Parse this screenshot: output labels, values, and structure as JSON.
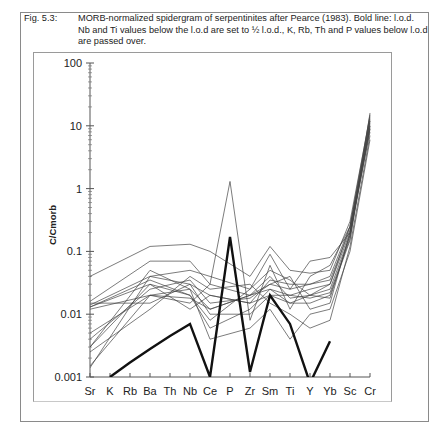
{
  "caption": {
    "label": "Fig. 5.3:",
    "text": "MORB-normalized spidergram of serpentinites after Pearce (1983). Bold line: l.o.d. Nb and Ti values below the l.o.d are set to ½ l.o.d., K, Rb, Th and P values below l.o.d are passed over."
  },
  "chart_data": {
    "type": "line",
    "title": "MORB-normalized spidergram of serpentinites after Pearce (1983)",
    "xlabel": "",
    "ylabel": "C/Cmorb",
    "yscale": "log",
    "ylim": [
      0.001,
      100
    ],
    "yticks": [
      "100",
      "10",
      "1",
      "0.1",
      "0.01",
      "0.001"
    ],
    "grid": false,
    "legend": null,
    "categories": [
      "Sr",
      "K",
      "Rb",
      "Ba",
      "Th",
      "Nb",
      "Ce",
      "P",
      "Zr",
      "Sm",
      "Ti",
      "Y",
      "Yb",
      "Sc",
      "Cr"
    ],
    "series": [
      {
        "name": "sample 1",
        "bold": false,
        "values": [
          0.04,
          null,
          null,
          0.12,
          null,
          0.13,
          0.1,
          null,
          0.04,
          0.12,
          0.05,
          0.045,
          0.05,
          0.3,
          14
        ]
      },
      {
        "name": "sample 2",
        "bold": false,
        "values": [
          0.016,
          null,
          null,
          0.07,
          null,
          0.07,
          0.03,
          1.3,
          0.008,
          0.06,
          0.012,
          0.04,
          0.06,
          0.25,
          12
        ]
      },
      {
        "name": "sample 3",
        "bold": false,
        "values": [
          0.014,
          null,
          null,
          0.04,
          null,
          0.05,
          0.04,
          null,
          0.025,
          0.09,
          0.025,
          0.07,
          0.08,
          0.2,
          10
        ]
      },
      {
        "name": "sample 4",
        "bold": false,
        "values": [
          0.0014,
          null,
          null,
          0.04,
          null,
          0.03,
          0.02,
          null,
          0.015,
          0.035,
          0.03,
          0.03,
          0.04,
          0.25,
          9
        ]
      },
      {
        "name": "sample 5",
        "bold": false,
        "values": [
          0.003,
          null,
          null,
          0.03,
          null,
          0.02,
          0.006,
          null,
          0.012,
          0.025,
          0.02,
          0.025,
          0.03,
          0.2,
          8
        ]
      },
      {
        "name": "sample 6",
        "bold": false,
        "values": [
          0.012,
          null,
          null,
          0.02,
          null,
          0.018,
          0.012,
          null,
          0.02,
          0.04,
          0.018,
          0.02,
          0.025,
          0.18,
          11
        ]
      },
      {
        "name": "sample 7",
        "bold": false,
        "values": [
          0.015,
          null,
          null,
          0.015,
          null,
          0.03,
          0.01,
          null,
          0.01,
          0.02,
          0.015,
          0.015,
          0.02,
          0.15,
          16
        ]
      },
      {
        "name": "sample 8",
        "bold": false,
        "values": [
          0.004,
          null,
          null,
          0.025,
          null,
          0.035,
          0.015,
          null,
          0.018,
          0.03,
          0.04,
          0.012,
          0.015,
          0.2,
          12
        ]
      },
      {
        "name": "sample 9",
        "bold": false,
        "values": [
          0.0025,
          null,
          null,
          0.012,
          null,
          0.04,
          0.025,
          null,
          0.03,
          0.015,
          0.01,
          0.006,
          0.008,
          0.12,
          7
        ]
      },
      {
        "name": "sample 10",
        "bold": false,
        "values": [
          0.005,
          null,
          null,
          0.02,
          null,
          0.015,
          0.03,
          null,
          0.02,
          0.03,
          0.025,
          0.03,
          0.035,
          0.22,
          13
        ]
      },
      {
        "name": "sample 11",
        "bold": false,
        "values": [
          0.013,
          null,
          null,
          0.035,
          null,
          0.02,
          0.008,
          null,
          0.025,
          0.05,
          0.035,
          0.02,
          0.03,
          0.25,
          15
        ]
      },
      {
        "name": "sample 12",
        "bold": false,
        "values": [
          0.0015,
          null,
          null,
          0.02,
          null,
          0.025,
          0.004,
          null,
          0.006,
          0.012,
          0.004,
          0.01,
          0.012,
          0.1,
          6
        ]
      },
      {
        "name": "sample 13",
        "bold": false,
        "values": [
          0.013,
          null,
          null,
          0.03,
          null,
          0.012,
          0.02,
          null,
          0.015,
          0.02,
          0.02,
          0.018,
          0.022,
          0.16,
          10
        ]
      },
      {
        "name": "sample 14",
        "bold": false,
        "values": [
          0.003,
          null,
          null,
          0.05,
          null,
          0.025,
          0.012,
          null,
          0.02,
          0.025,
          0.015,
          0.02,
          0.018,
          0.18,
          9
        ]
      },
      {
        "name": "sample 15 (l.o.d.)",
        "bold": true,
        "values": [
          null,
          0.001,
          0.0017,
          0.0028,
          0.0045,
          0.007,
          0.001,
          0.17,
          0.0012,
          0.02,
          0.007,
          0.0008,
          0.0037,
          null,
          null
        ]
      }
    ]
  }
}
